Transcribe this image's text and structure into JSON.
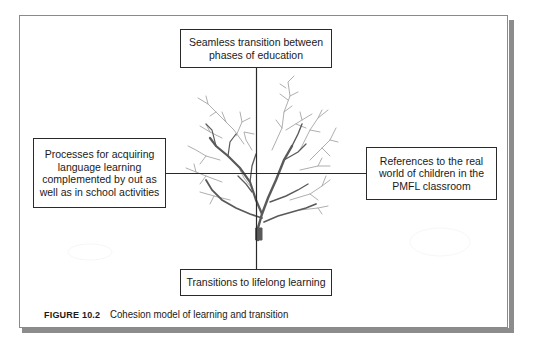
{
  "diagram": {
    "type": "cohesion-model",
    "center": "tree",
    "boxes": {
      "top": "Seamless transition between\nphases of education",
      "left": "Processes for acquiring\nlanguage learning\ncomplemented by out as\nwell as in school activities",
      "right": "References to the real\nworld of children in the\nPMFL classroom",
      "bottom": "Transitions to lifelong learning"
    }
  },
  "caption": {
    "label": "FIGURE 10.2",
    "title": "Cohesion model of learning and transition"
  },
  "colors": {
    "line": "#2a2a2a",
    "tree_dark": "#555555",
    "tree_light": "#9a9a9a",
    "frame_shadow": "#8c8c8c"
  }
}
